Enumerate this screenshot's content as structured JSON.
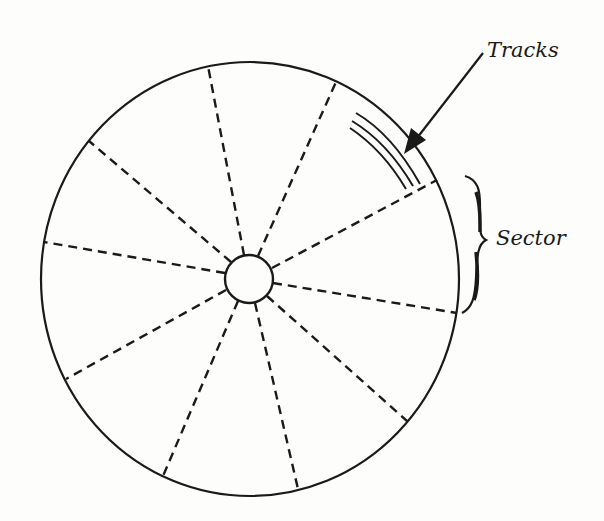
{
  "diagram": {
    "labels": {
      "tracks": "Tracks",
      "sector": "Sector"
    },
    "colors": {
      "ink": "#1a1a1a",
      "background": "#fdfdfb"
    },
    "disk": {
      "outer": {
        "cx": 250,
        "cy": 279,
        "rx": 209,
        "ry": 217
      },
      "hub": {
        "cx": 249,
        "cy": 279,
        "r": 24
      },
      "sector_count": 10,
      "spoke_endpoints_outer": [
        [
          208,
          66
        ],
        [
          336,
          82
        ],
        [
          437,
          180
        ],
        [
          457,
          313
        ],
        [
          407,
          421
        ],
        [
          298,
          489
        ],
        [
          163,
          476
        ],
        [
          66,
          379
        ],
        [
          44,
          242
        ],
        [
          89,
          141
        ]
      ],
      "track_count": 3
    }
  }
}
